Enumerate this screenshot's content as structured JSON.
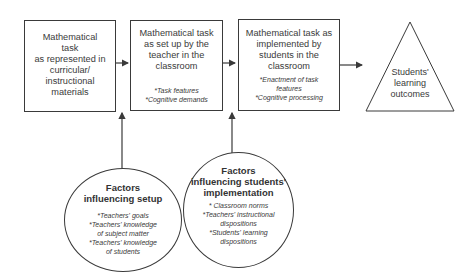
{
  "diagram": {
    "boxes": [
      {
        "id": "curricular",
        "title_lines": [
          "Mathematical",
          "task",
          "as represented in",
          "curricular/",
          "instructional",
          "materials"
        ],
        "notes": []
      },
      {
        "id": "setup",
        "title_lines": [
          "Mathematical task",
          "as set up by the",
          "teacher in the",
          "classroom"
        ],
        "notes": [
          "*Task features",
          "*Cognitive demands"
        ]
      },
      {
        "id": "implemented",
        "title_lines": [
          "Mathematical task as",
          "implemented by",
          "students in the",
          "classroom"
        ],
        "notes": [
          "*Enactment of task",
          "features",
          "*Cognitive processing"
        ]
      }
    ],
    "outcome": {
      "label_lines": [
        "Students'",
        "learning",
        "outcomes"
      ]
    },
    "factors": [
      {
        "id": "setup-factors",
        "title_lines": [
          "Factors",
          "influencing setup"
        ],
        "notes": [
          "*Teachers' goals",
          "*Teachers' knowledge",
          "of subject matter",
          "*Teachers' knowledge",
          "of students"
        ]
      },
      {
        "id": "implementation-factors",
        "title_lines": [
          "Factors",
          "influencing students'",
          "implementation"
        ],
        "notes": [
          "* Classroom norms",
          "*Teachers' instructional",
          "dispositions",
          "*Students' learning",
          "dispositions"
        ]
      }
    ],
    "colors": {
      "stroke": "#3a3a3a",
      "background": "#ffffff"
    }
  }
}
